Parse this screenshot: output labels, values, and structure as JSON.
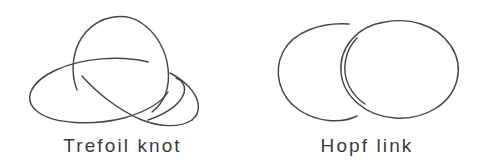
{
  "figure": {
    "background_color": "#ffffff",
    "stroke_color": "#45454d",
    "text_color": "#3a3a42",
    "width": 489,
    "height": 168
  },
  "panels": [
    {
      "id": "trefoil",
      "caption": "Trefoil knot",
      "crossing_number": 3,
      "components": 1,
      "description": "Tilted ellipse interlocked with an upper loop forming three alternating crossings"
    },
    {
      "id": "hopf",
      "caption": "Hopf link",
      "crossing_number": 2,
      "components": 2,
      "description": "Two overlapping circles, right circle passing over the left at both crossings"
    }
  ]
}
